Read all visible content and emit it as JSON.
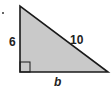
{
  "diagram": {
    "type": "right-triangle",
    "bullet": "•",
    "labels": {
      "left_leg": "6",
      "hypotenuse": "10",
      "base": "b"
    },
    "right_angle_marker": true,
    "colors": {
      "fill": "#c9c9c9",
      "stroke": "#1a1a1a"
    }
  }
}
